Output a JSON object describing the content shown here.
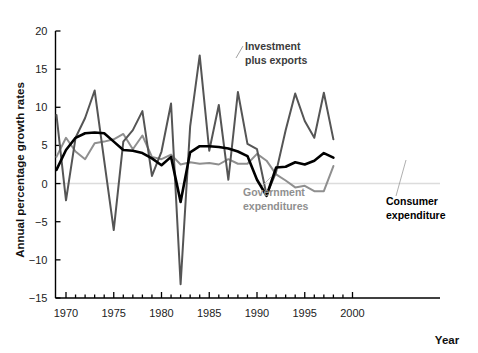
{
  "chart_data": {
    "type": "line",
    "title": "",
    "xlabel": "Year",
    "ylabel": "Annual percentage growth rates",
    "xlim": [
      1969,
      2000
    ],
    "ylim": [
      -15,
      20
    ],
    "ytick_values": [
      20,
      15,
      10,
      5,
      0,
      -5,
      -10,
      -15
    ],
    "ytick_labels": [
      "20",
      "15",
      "10",
      "5",
      "0",
      "-5",
      "-10",
      "-15"
    ],
    "xtick_values": [
      1970,
      1975,
      1980,
      1985,
      1990,
      1995,
      2000
    ],
    "xtick_labels": [
      "1970",
      "1975",
      "1980",
      "1985",
      "1990",
      "1995",
      "2000"
    ],
    "minor_xticks_every": 1,
    "grid": false,
    "zero_line": true,
    "legend_position": "inline-annotations",
    "x": [
      1969,
      1970,
      1971,
      1972,
      1973,
      1974,
      1975,
      1976,
      1977,
      1978,
      1979,
      1980,
      1981,
      1982,
      1983,
      1984,
      1985,
      1986,
      1987,
      1988,
      1989,
      1990,
      1991,
      1992,
      1993,
      1994,
      1995,
      1996,
      1997,
      1998
    ],
    "series": [
      {
        "name": "Investment plus exports",
        "color": "#555555",
        "values": [
          9.0,
          -2.2,
          6.0,
          8.6,
          12.2,
          3.0,
          -6.1,
          5.5,
          7.0,
          9.5,
          1.0,
          4.2,
          10.5,
          -13.2,
          7.5,
          16.8,
          4.3,
          10.3,
          0.5,
          12.0,
          5.2,
          4.5,
          -1.5,
          1.5,
          7.0,
          11.8,
          8.2,
          6.0,
          11.9,
          5.8
        ]
      },
      {
        "name": "Government expenditures",
        "color": "#8f8f8f",
        "values": [
          3.5,
          6.0,
          4.2,
          3.2,
          5.3,
          5.5,
          5.8,
          6.5,
          4.5,
          6.3,
          3.5,
          3.2,
          3.8,
          2.5,
          2.8,
          2.6,
          2.7,
          2.5,
          3.2,
          2.6,
          2.6,
          3.9,
          3.0,
          1.2,
          0.4,
          -0.5,
          -0.3,
          -1.0,
          -1.0,
          2.3
        ]
      },
      {
        "name": "Consumer expenditure",
        "color": "#000000",
        "values": [
          1.8,
          4.4,
          6.0,
          6.6,
          6.7,
          6.6,
          5.5,
          4.4,
          4.3,
          4.0,
          3.3,
          2.4,
          3.5,
          -2.4,
          4.1,
          4.9,
          4.9,
          4.8,
          4.6,
          4.2,
          3.6,
          0.5,
          -1.6,
          2.1,
          2.2,
          2.8,
          2.5,
          3.0,
          4.0,
          3.4
        ]
      }
    ],
    "annotations": [
      {
        "name": "investment-plus-exports",
        "text_line1": "Investment",
        "text_line2": "plus exports",
        "color": "#3b3b3b"
      },
      {
        "name": "government-expenditures",
        "text_line1": "Government",
        "text_line2": "expenditures",
        "color": "#8f8f8f"
      },
      {
        "name": "consumer-expenditure",
        "text_line1": "Consumer",
        "text_line2": "expenditure",
        "color": "#000000"
      }
    ]
  }
}
